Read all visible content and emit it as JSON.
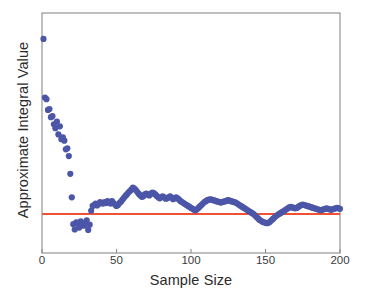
{
  "figure": {
    "background_color": "#ffffff",
    "frame_color": "#8a8a8a",
    "plot_area": {
      "left": 42,
      "top": 13,
      "right": 340,
      "bottom": 253
    }
  },
  "axis": {
    "x_label": "Sample Size",
    "y_label": "Approximate Integral Value",
    "x_tick_labels": [
      "0",
      "50",
      "100",
      "150",
      "200"
    ]
  },
  "chart_data": {
    "type": "scatter",
    "title": "",
    "xlabel": "Sample Size",
    "ylabel": "Approximate Integral Value",
    "xlim": [
      0,
      200
    ],
    "ylim": [
      0.0,
      1.0
    ],
    "xticks": [
      0,
      50,
      100,
      150,
      200
    ],
    "yticks": [],
    "grid": false,
    "legend": false,
    "y_axis_numeric_labels_shown": false,
    "marker_color": "#4c56a8",
    "marker_size": 4,
    "reference_line": {
      "name": "True integral value",
      "orientation": "horizontal",
      "y": 0.1625,
      "color": "#ef5134",
      "width": 2
    },
    "series": [
      {
        "name": "Approximate integral value",
        "color": "#4c56a8",
        "x": [
          1,
          2,
          3,
          4,
          5,
          6,
          7,
          8,
          9,
          10,
          11,
          12,
          13,
          14,
          15,
          16,
          17,
          18,
          19,
          20,
          21,
          22,
          23,
          24,
          25,
          26,
          27,
          28,
          29,
          30,
          31,
          32,
          33,
          34,
          35,
          36,
          37,
          38,
          39,
          40,
          41,
          42,
          43,
          44,
          45,
          46,
          47,
          48,
          49,
          50,
          51,
          52,
          53,
          54,
          55,
          56,
          57,
          58,
          59,
          60,
          61,
          62,
          63,
          64,
          65,
          66,
          67,
          68,
          69,
          70,
          71,
          72,
          73,
          74,
          75,
          76,
          77,
          78,
          79,
          80,
          81,
          82,
          83,
          84,
          85,
          86,
          87,
          88,
          89,
          90,
          91,
          92,
          93,
          94,
          95,
          96,
          97,
          98,
          99,
          100,
          101,
          102,
          103,
          104,
          105,
          106,
          107,
          108,
          109,
          110,
          111,
          112,
          113,
          114,
          115,
          116,
          117,
          118,
          119,
          120,
          121,
          122,
          123,
          124,
          125,
          126,
          127,
          128,
          129,
          130,
          131,
          132,
          133,
          134,
          135,
          136,
          137,
          138,
          139,
          140,
          141,
          142,
          143,
          144,
          145,
          146,
          147,
          148,
          149,
          150,
          151,
          152,
          153,
          154,
          155,
          156,
          157,
          158,
          159,
          160,
          161,
          162,
          163,
          164,
          165,
          166,
          167,
          168,
          169,
          170,
          171,
          172,
          173,
          174,
          175,
          176,
          177,
          178,
          179,
          180,
          181,
          182,
          183,
          184,
          185,
          186,
          187,
          188,
          189,
          190,
          191,
          192,
          193,
          194,
          195,
          196,
          197,
          198,
          199,
          200
        ],
        "y": [
          0.892,
          0.648,
          0.641,
          0.596,
          0.6,
          0.566,
          0.57,
          0.536,
          0.52,
          0.548,
          0.494,
          0.528,
          0.474,
          0.482,
          0.468,
          0.432,
          0.436,
          0.404,
          0.33,
          0.232,
          0.12,
          0.098,
          0.128,
          0.122,
          0.106,
          0.132,
          0.124,
          0.114,
          0.12,
          0.136,
          0.096,
          0.118,
          0.176,
          0.196,
          0.2,
          0.206,
          0.198,
          0.204,
          0.212,
          0.208,
          0.206,
          0.212,
          0.208,
          0.216,
          0.212,
          0.206,
          0.216,
          0.208,
          0.202,
          0.196,
          0.2,
          0.208,
          0.214,
          0.222,
          0.23,
          0.238,
          0.244,
          0.252,
          0.258,
          0.264,
          0.272,
          0.268,
          0.262,
          0.254,
          0.246,
          0.24,
          0.234,
          0.236,
          0.244,
          0.248,
          0.244,
          0.24,
          0.246,
          0.252,
          0.25,
          0.244,
          0.238,
          0.232,
          0.228,
          0.232,
          0.236,
          0.232,
          0.226,
          0.228,
          0.232,
          0.236,
          0.23,
          0.224,
          0.228,
          0.232,
          0.228,
          0.222,
          0.216,
          0.212,
          0.208,
          0.204,
          0.2,
          0.196,
          0.192,
          0.188,
          0.184,
          0.18,
          0.178,
          0.182,
          0.188,
          0.194,
          0.2,
          0.206,
          0.212,
          0.216,
          0.22,
          0.222,
          0.224,
          0.222,
          0.22,
          0.218,
          0.216,
          0.214,
          0.212,
          0.21,
          0.212,
          0.214,
          0.216,
          0.218,
          0.22,
          0.218,
          0.216,
          0.214,
          0.212,
          0.21,
          0.206,
          0.202,
          0.198,
          0.194,
          0.19,
          0.186,
          0.182,
          0.178,
          0.174,
          0.17,
          0.166,
          0.162,
          0.156,
          0.15,
          0.144,
          0.138,
          0.134,
          0.13,
          0.128,
          0.126,
          0.124,
          0.126,
          0.13,
          0.136,
          0.142,
          0.148,
          0.154,
          0.158,
          0.162,
          0.166,
          0.17,
          0.174,
          0.178,
          0.182,
          0.186,
          0.19,
          0.192,
          0.19,
          0.188,
          0.186,
          0.188,
          0.192,
          0.196,
          0.2,
          0.202,
          0.2,
          0.198,
          0.196,
          0.194,
          0.192,
          0.19,
          0.188,
          0.186,
          0.184,
          0.182,
          0.18,
          0.178,
          0.18,
          0.182,
          0.184,
          0.186,
          0.184,
          0.182,
          0.18,
          0.182,
          0.184,
          0.186,
          0.188,
          0.186,
          0.184
        ]
      }
    ]
  }
}
